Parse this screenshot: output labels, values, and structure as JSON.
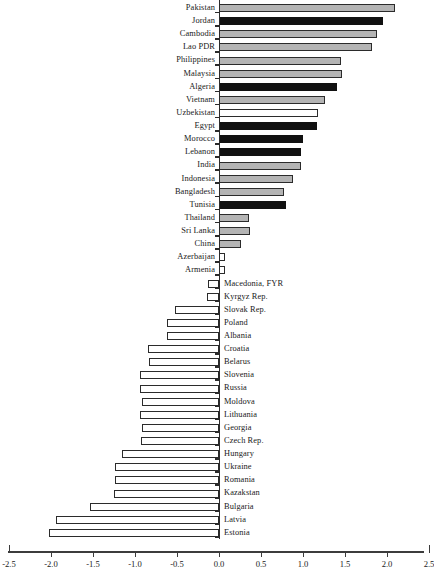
{
  "chart_data": {
    "type": "bar",
    "orientation": "horizontal",
    "title": "",
    "subtitle": "",
    "xlabel": "",
    "ylabel": "",
    "xlim": [
      -2.5,
      2.5
    ],
    "grid": false,
    "legend_position": "none",
    "xticks": [
      -2.5,
      -2.0,
      -1.5,
      -1.0,
      -0.5,
      0.0,
      0.5,
      1.0,
      1.5,
      2.0,
      2.5
    ],
    "xtick_labels": [
      "-2.5",
      "-2.0",
      "-1.5",
      "-1.0",
      "-0.5",
      "0.0",
      "0.5",
      "1.0",
      "1.5",
      "2.0",
      "2.5"
    ],
    "styles": {
      "gray": "#b4b4b4",
      "black": "#111111",
      "white": "#ffffff",
      "outline": "#2b2b2b"
    },
    "categories": [
      "Pakistan",
      "Jordan",
      "Cambodia",
      "Lao PDR",
      "Philippines",
      "Malaysia",
      "Algeria",
      "Vietnam",
      "Uzbekistan",
      "Egypt",
      "Morocco",
      "Lebanon",
      "India",
      "Indonesia",
      "Bangladesh",
      "Tunisia",
      "Thailand",
      "Sri Lanka",
      "China",
      "Azerbaijan",
      "Armenia",
      "Macedonia, FYR",
      "Kyrgyz Rep.",
      "Slovak Rep.",
      "Poland",
      "Albania",
      "Croatia",
      "Belarus",
      "Slovenia",
      "Russia",
      "Moldova",
      "Lithuania",
      "Georgia",
      "Czech Rep.",
      "Hungary",
      "Ukraine",
      "Romania",
      "Kazakstan",
      "Bulgaria",
      "Latvia",
      "Estonia"
    ],
    "values": [
      2.1,
      1.95,
      1.88,
      1.82,
      1.45,
      1.46,
      1.4,
      1.26,
      1.18,
      1.17,
      1.0,
      0.98,
      0.98,
      0.88,
      0.77,
      0.8,
      0.36,
      0.37,
      0.26,
      0.07,
      0.07,
      -0.13,
      -0.14,
      -0.52,
      -0.62,
      -0.62,
      -0.85,
      -0.83,
      -0.94,
      -0.94,
      -0.92,
      -0.94,
      -0.92,
      -0.93,
      -1.15,
      -1.24,
      -1.24,
      -1.25,
      -1.54,
      -1.94,
      -2.02
    ],
    "fills": [
      "gray",
      "black",
      "gray",
      "gray",
      "gray",
      "gray",
      "black",
      "gray",
      "white",
      "black",
      "black",
      "black",
      "gray",
      "gray",
      "gray",
      "black",
      "gray",
      "gray",
      "gray",
      "white",
      "white",
      "white",
      "white",
      "white",
      "white",
      "white",
      "white",
      "white",
      "white",
      "white",
      "white",
      "white",
      "white",
      "white",
      "white",
      "white",
      "white",
      "white",
      "white",
      "white",
      "white"
    ]
  }
}
